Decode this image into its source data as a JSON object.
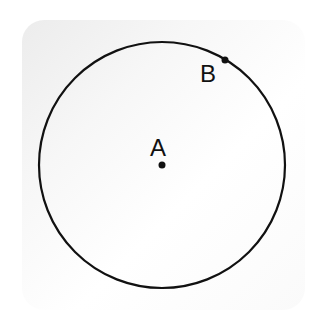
{
  "diagram": {
    "circle": {
      "cx": 162,
      "cy": 165,
      "r": 123,
      "stroke": "#111111"
    },
    "points": [
      {
        "label": "A",
        "x": 162,
        "y": 165,
        "label_x": 150,
        "label_y": 156,
        "role": "center"
      },
      {
        "label": "B",
        "x": 225,
        "y": 60,
        "label_x": 200,
        "label_y": 82,
        "role": "on-circle"
      }
    ],
    "background": {
      "card_color": "#f4f4f4"
    }
  }
}
